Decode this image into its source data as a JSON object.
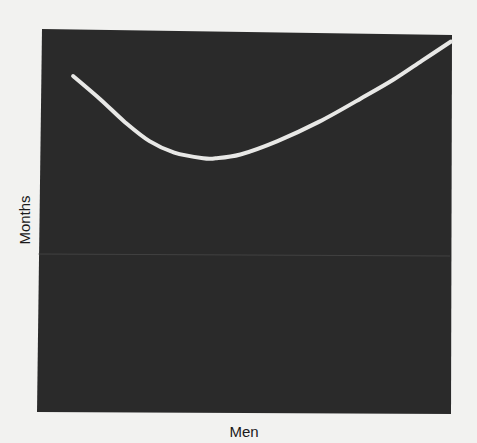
{
  "chart_data": {
    "type": "line",
    "title": "",
    "xlabel": "Men",
    "ylabel": "Months",
    "x_ticks": [],
    "y_ticks": [],
    "grid": false,
    "legend": null,
    "units": "relative (0-1, no tick values shown)",
    "xlim": [
      0,
      1
    ],
    "ylim": [
      0,
      1
    ],
    "series": [
      {
        "name": "Months vs Men",
        "x": [
          0.085,
          0.15,
          0.21,
          0.27,
          0.33,
          0.4,
          0.43,
          0.49,
          0.58,
          0.68,
          0.78,
          0.86,
          0.93,
          1.0
        ],
        "y": [
          0.88,
          0.82,
          0.76,
          0.71,
          0.68,
          0.665,
          0.665,
          0.675,
          0.71,
          0.76,
          0.82,
          0.87,
          0.92,
          0.97
        ]
      }
    ],
    "colors": {
      "plot_background": "#2a2a2a",
      "line": "#e8e8e6",
      "page_background": "#f2f2f0"
    }
  }
}
